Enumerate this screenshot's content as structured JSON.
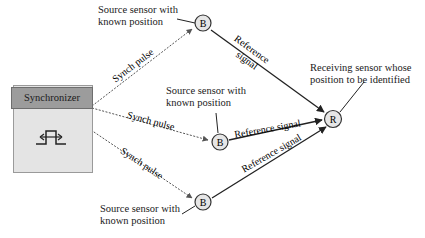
{
  "diagram": {
    "synchronizer": {
      "title": "Synchronizer",
      "icon": "pulse-waveform-icon"
    },
    "source_nodes": [
      {
        "label": "B",
        "caption_line1": "Source sensor with",
        "caption_line2": "known position",
        "x": 203,
        "y": 23
      },
      {
        "label": "B",
        "caption_line1": "Source sensor with",
        "caption_line2": "known position",
        "x": 220,
        "y": 142
      },
      {
        "label": "B",
        "caption_line1": "Source sensor with",
        "caption_line2": "known position",
        "x": 203,
        "y": 202
      }
    ],
    "receiver_node": {
      "label": "R",
      "caption_line1": "Receiving sensor whose",
      "caption_line2": "position to be identified",
      "x": 333,
      "y": 119
    },
    "edges": {
      "synch_pulse_label": "Synch pulse",
      "reference_signal_label_top_line1": "Reference",
      "reference_signal_label_top_line2": "signal",
      "reference_signal_label": "Reference signal"
    },
    "colors": {
      "node_fill": "#e6e6e6",
      "node_stroke": "#333333",
      "sync_header": "#9c9c9c",
      "sync_body": "#e4e4e4"
    }
  }
}
